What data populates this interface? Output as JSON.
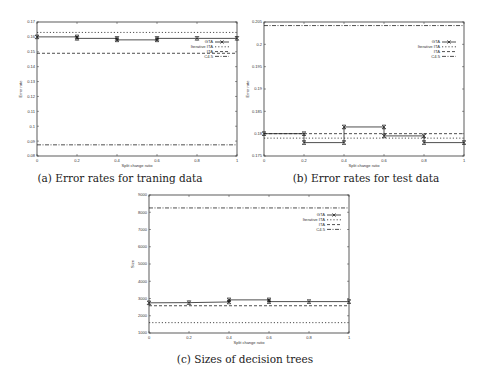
{
  "figure": {
    "captions": {
      "a": "(a) Error rates for traning data",
      "b": "(b) Error rates for test data",
      "c": "(c) Sizes of decision trees"
    }
  },
  "chart_data": [
    {
      "id": "a",
      "type": "line",
      "title": "(a) Error rates for traning data",
      "xlabel": "Split change ratio",
      "ylabel": "Error rate",
      "xlim": [
        0,
        1
      ],
      "ylim": [
        0.08,
        0.17
      ],
      "xticks": [
        "0",
        "0.2",
        "0.4",
        "0.6",
        "0.8",
        "1"
      ],
      "yticks": [
        "0.08",
        "0.09",
        "0.1",
        "0.11",
        "0.12",
        "0.13",
        "0.14",
        "0.15",
        "0.16",
        "0.17"
      ],
      "legend_position": "right-upper-inside",
      "series": [
        {
          "name": "GTA",
          "style": "solid-markers",
          "x": [
            0,
            0.2,
            0.2,
            0.4,
            0.4,
            0.6,
            0.6,
            0.8,
            1
          ],
          "y": [
            0.16,
            0.16,
            0.159,
            0.159,
            0.158,
            0.158,
            0.159,
            0.159,
            0.159
          ]
        },
        {
          "name": "Iterative ITA",
          "style": "dotted",
          "x": [
            0,
            1
          ],
          "y": [
            0.163,
            0.163
          ]
        },
        {
          "name": "ITA",
          "style": "dashed",
          "x": [
            0,
            1
          ],
          "y": [
            0.149,
            0.149
          ]
        },
        {
          "name": "C4.5",
          "style": "dashdot",
          "x": [
            0,
            1
          ],
          "y": [
            0.0875,
            0.0875
          ]
        }
      ]
    },
    {
      "id": "b",
      "type": "line",
      "title": "(b) Error rates for test data",
      "xlabel": "Split change ratio",
      "ylabel": "Error rate",
      "xlim": [
        0,
        1
      ],
      "ylim": [
        0.175,
        0.205
      ],
      "xticks": [
        "0",
        "0.2",
        "0.4",
        "0.6",
        "0.8",
        "1"
      ],
      "yticks": [
        "0.175",
        "0.18",
        "0.185",
        "0.19",
        "0.195",
        "0.2",
        "0.205"
      ],
      "legend_position": "right-upper-inside",
      "series": [
        {
          "name": "GTA",
          "style": "solid-markers",
          "x": [
            0,
            0.2,
            0.2,
            0.4,
            0.4,
            0.6,
            0.6,
            0.8,
            0.8,
            1
          ],
          "y": [
            0.18,
            0.18,
            0.178,
            0.178,
            0.1815,
            0.1815,
            0.1795,
            0.1795,
            0.178,
            0.178
          ]
        },
        {
          "name": "Iterative ITA",
          "style": "dotted",
          "x": [
            0,
            1
          ],
          "y": [
            0.179,
            0.179
          ]
        },
        {
          "name": "ITA",
          "style": "dashed",
          "x": [
            0,
            1
          ],
          "y": [
            0.18,
            0.18
          ]
        },
        {
          "name": "C4.5",
          "style": "dashdot",
          "x": [
            0,
            1
          ],
          "y": [
            0.2042,
            0.2042
          ]
        }
      ]
    },
    {
      "id": "c",
      "type": "line",
      "title": "(c) Sizes of decision trees",
      "xlabel": "Split change ratio",
      "ylabel": "Size",
      "xlim": [
        0,
        1
      ],
      "ylim": [
        1000,
        9000
      ],
      "xticks": [
        "0",
        "0.2",
        "0.4",
        "0.6",
        "0.8",
        "1"
      ],
      "yticks": [
        "1000",
        "2000",
        "3000",
        "4000",
        "5000",
        "6000",
        "7000",
        "8000",
        "9000"
      ],
      "legend_position": "right-upper-inside",
      "series": [
        {
          "name": "GTA",
          "style": "solid-markers",
          "x": [
            0,
            0.2,
            0.4,
            0.4,
            0.6,
            0.6,
            0.8,
            1
          ],
          "y": [
            2750,
            2760,
            2800,
            2920,
            2920,
            2820,
            2820,
            2820
          ]
        },
        {
          "name": "Iterative ITA",
          "style": "dotted",
          "x": [
            0,
            1
          ],
          "y": [
            1600,
            1600
          ]
        },
        {
          "name": "ITA",
          "style": "dashed",
          "x": [
            0,
            1
          ],
          "y": [
            2580,
            2580
          ]
        },
        {
          "name": "C4.5",
          "style": "dashdot",
          "x": [
            0,
            1
          ],
          "y": [
            8250,
            8250
          ]
        }
      ]
    }
  ]
}
